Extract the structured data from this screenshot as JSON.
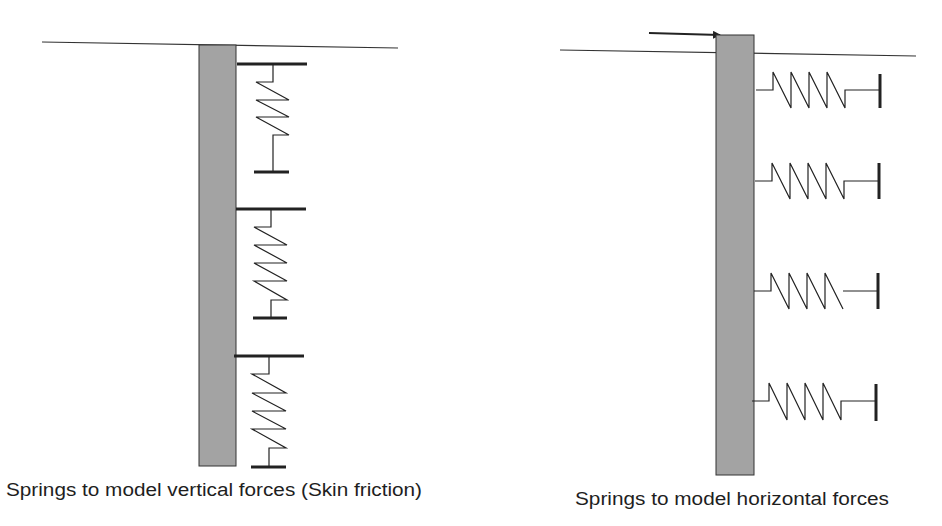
{
  "diagram": {
    "colors": {
      "pile": "#a3a3a3",
      "line": "#222222",
      "background": "#ffffff"
    },
    "left_panel": {
      "caption": "Springs to model vertical forces (Skin friction)",
      "pile": "pile",
      "ground_line": "ground surface",
      "springs": [
        {
          "label": "vertical spring 1"
        },
        {
          "label": "vertical spring 2"
        },
        {
          "label": "vertical spring 3"
        }
      ]
    },
    "right_panel": {
      "caption": "Springs to model horizontal forces",
      "pile": "pile",
      "ground_line": "ground surface",
      "load_arrow": "horizontal load",
      "springs": [
        {
          "label": "horizontal spring 1"
        },
        {
          "label": "horizontal spring 2"
        },
        {
          "label": "horizontal spring 3"
        },
        {
          "label": "horizontal spring 4"
        }
      ]
    }
  }
}
